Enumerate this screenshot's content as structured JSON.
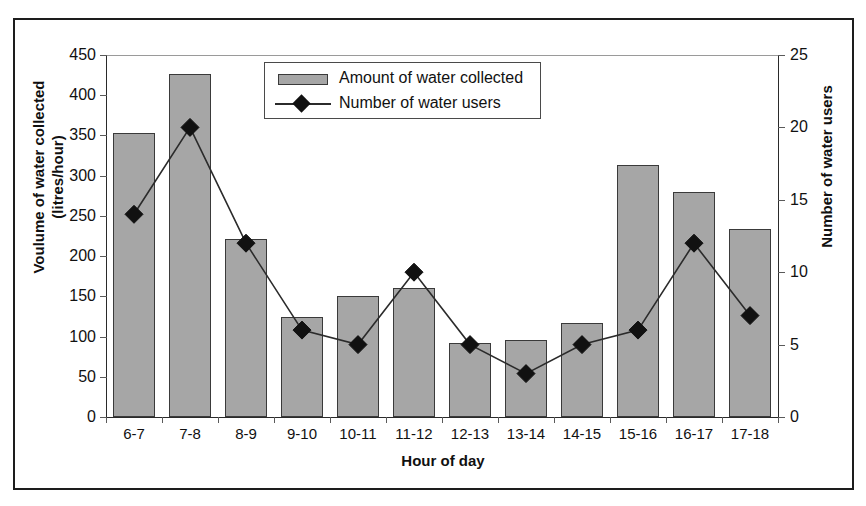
{
  "chart_data": {
    "type": "bar",
    "title": "",
    "subtitle": "",
    "xlabel": "Hour of day",
    "ylabel": "Voulume of water collected (litres/hour)",
    "ylabel_line1": "Voulume of water collected",
    "ylabel_line2": "(litres/hour)",
    "y2label": "Number of water users",
    "categories": [
      "6-7",
      "7-8",
      "8-9",
      "9-10",
      "10-11",
      "11-12",
      "12-13",
      "13-14",
      "14-15",
      "15-16",
      "16-17",
      "17-18"
    ],
    "ylim": [
      0,
      450
    ],
    "y2lim": [
      0,
      25
    ],
    "yticks": [
      0,
      50,
      100,
      150,
      200,
      250,
      300,
      350,
      400,
      450
    ],
    "y2ticks": [
      0,
      5,
      10,
      15,
      20,
      25
    ],
    "grid": false,
    "legend_position": "top-center",
    "series": [
      {
        "name": "Amount of water collected",
        "type": "bar",
        "axis": "left",
        "color": "#a6a6a6",
        "edge_color": "#3a3a3a",
        "values": [
          353,
          426,
          221,
          124,
          150,
          160,
          92,
          96,
          117,
          313,
          280,
          234
        ]
      },
      {
        "name": "Number of water users",
        "type": "line",
        "axis": "right",
        "color": "#2b2b2b",
        "marker": "diamond",
        "values": [
          14,
          20,
          12,
          6,
          5,
          10,
          5,
          3,
          5,
          6,
          12,
          7
        ]
      }
    ]
  },
  "legend": {
    "items": [
      {
        "label": "Amount of water collected",
        "icon": "bar-swatch-icon"
      },
      {
        "label": "Number of water users",
        "icon": "line-marker-icon"
      }
    ]
  },
  "axes": {
    "left": {
      "title_line1": "Voulume of water collected",
      "title_line2": "(litres/hour)",
      "ticks": [
        "450",
        "400",
        "350",
        "300",
        "250",
        "200",
        "150",
        "100",
        "50",
        "0"
      ]
    },
    "right": {
      "title": "Number of water users",
      "ticks": [
        "25",
        "20",
        "15",
        "10",
        "5",
        "0"
      ]
    },
    "bottom": {
      "title": "Hour of day",
      "ticks": [
        "6-7",
        "7-8",
        "8-9",
        "9-10",
        "10-11",
        "11-12",
        "12-13",
        "13-14",
        "14-15",
        "15-16",
        "16-17",
        "17-18"
      ]
    }
  }
}
